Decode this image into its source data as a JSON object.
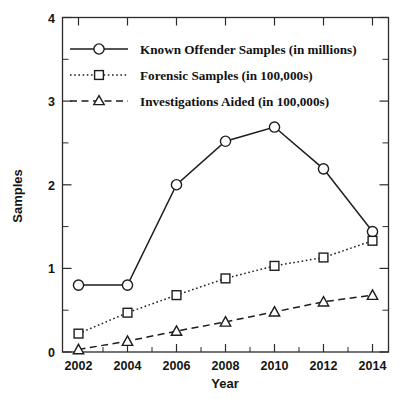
{
  "chart_data": {
    "type": "line",
    "title": "",
    "xlabel": "Year",
    "ylabel": "Samples",
    "categories": [
      2002,
      2004,
      2006,
      2008,
      2010,
      2012,
      2014
    ],
    "x": [
      2002,
      2004,
      2006,
      2008,
      2010,
      2012,
      2014
    ],
    "xlim": [
      2001,
      2015
    ],
    "ylim": [
      0,
      4
    ],
    "ytick_labels": [
      "0",
      "1",
      "2",
      "3",
      "4"
    ],
    "yticks": [
      0,
      1,
      2,
      3,
      4
    ],
    "y_minor_ticks": [
      0.5,
      1.5,
      2.5,
      3.5
    ],
    "xtick_labels": [
      "2002",
      "2004",
      "2006",
      "2008",
      "2010",
      "2012",
      "2014"
    ],
    "grid": false,
    "legend_position": "upper left",
    "series": [
      {
        "name": "Known Offender Samples (in millions)",
        "marker": "circle",
        "linestyle": "solid",
        "values": [
          0.8,
          0.8,
          2.0,
          2.52,
          2.69,
          2.19,
          1.44
        ]
      },
      {
        "name": "Forensic Samples (in 100,000s)",
        "marker": "square",
        "linestyle": "dotted",
        "values": [
          0.22,
          0.47,
          0.68,
          0.88,
          1.03,
          1.13,
          1.33
        ]
      },
      {
        "name": "Investigations Aided (in 100,000s)",
        "marker": "triangle",
        "linestyle": "dashed",
        "values": [
          0.03,
          0.13,
          0.25,
          0.36,
          0.48,
          0.6,
          0.68
        ]
      }
    ]
  },
  "axes": {
    "y_title": "Samples",
    "x_title": "Year",
    "y_labels": [
      "4",
      "3",
      "2",
      "1",
      "0"
    ],
    "x_labels": [
      "2002",
      "2004",
      "2006",
      "2008",
      "2010",
      "2012",
      "2014"
    ]
  },
  "legend": {
    "entries": [
      {
        "label": "Known Offender Samples (in millions)",
        "marker": "circle-marker",
        "style": "solid-line"
      },
      {
        "label": "Forensic Samples (in 100,000s)",
        "marker": "square-marker",
        "style": "dotted-line"
      },
      {
        "label": "Investigations Aided (in 100,000s)",
        "marker": "triangle-marker",
        "style": "dashed-line"
      }
    ]
  },
  "colors": {
    "ink": "#1d1d1d",
    "frame": "#2b2b2b",
    "background": "#ffffff",
    "marker_fill": "#ffffff"
  }
}
